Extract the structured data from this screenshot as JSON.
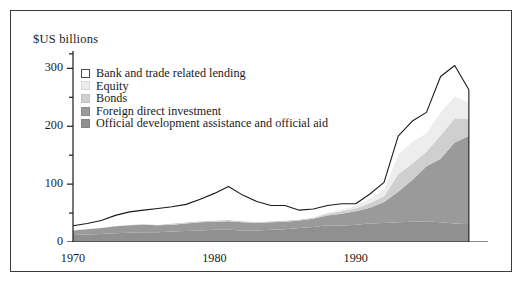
{
  "figure": {
    "axis_title": "$US billions",
    "border_color": "#3c3c3c",
    "background": "#ffffff"
  },
  "legend": {
    "items": [
      {
        "label": "Bank and trade related lending",
        "color": "#ffffff",
        "key": "bank_and_trade_related_lending"
      },
      {
        "label": "Equity",
        "color": "#ededed",
        "key": "equity"
      },
      {
        "label": "Bonds",
        "color": "#cfcfcf",
        "key": "bonds"
      },
      {
        "label": "Foreign direct investment",
        "color": "#9a9a9a",
        "key": "foreign_direct_investment"
      },
      {
        "label": "Official development assistance and official aid",
        "color": "#909090",
        "key": "official_development_assistance_and_official_aid"
      }
    ]
  },
  "chart_data": {
    "type": "area",
    "stacked": true,
    "title": "",
    "subtitle": "",
    "xlabel": "",
    "ylabel": "$US billions",
    "xlim": [
      1970,
      1999
    ],
    "ylim": [
      0,
      330
    ],
    "yticks": [
      0,
      100,
      200,
      300
    ],
    "ytick_labels": [
      "0",
      "100",
      "200",
      "300"
    ],
    "yminor_ticks": [
      50,
      150,
      250,
      325
    ],
    "xticks": [
      1970,
      1972,
      1974,
      1976,
      1978,
      1980,
      1982,
      1984,
      1986,
      1988,
      1990,
      1992,
      1994,
      1996,
      1998
    ],
    "xtick_labels_shown": [
      "1970",
      "1980",
      "1990"
    ],
    "xtick_label_years": [
      1970,
      1980,
      1990
    ],
    "grid": false,
    "legend_position": "upper-left-inside",
    "x": [
      1970,
      1971,
      1972,
      1973,
      1974,
      1975,
      1976,
      1977,
      1978,
      1979,
      1980,
      1981,
      1982,
      1983,
      1984,
      1985,
      1986,
      1987,
      1988,
      1989,
      1990,
      1991,
      1992,
      1993,
      1994,
      1995,
      1996,
      1997,
      1998
    ],
    "series": [
      {
        "name": "Official development assistance and official aid",
        "color": "#909090",
        "values": [
          12,
          13,
          14,
          15,
          16,
          17,
          17,
          18,
          19,
          20,
          21,
          21,
          20,
          20,
          21,
          22,
          24,
          26,
          29,
          28,
          30,
          32,
          33,
          34,
          35,
          36,
          34,
          32,
          33
        ]
      },
      {
        "name": "Foreign direct investment",
        "color": "#9a9a9a",
        "values": [
          8,
          9,
          10,
          12,
          13,
          13,
          12,
          12,
          13,
          14,
          14,
          15,
          14,
          13,
          13,
          13,
          13,
          14,
          17,
          21,
          23,
          27,
          36,
          53,
          72,
          95,
          110,
          140,
          150
        ]
      },
      {
        "name": "Bonds",
        "color": "#cfcfcf",
        "values": [
          1,
          1,
          1,
          1,
          1,
          1,
          1,
          2,
          2,
          2,
          2,
          2,
          2,
          2,
          2,
          2,
          2,
          2,
          3,
          4,
          5,
          8,
          10,
          30,
          28,
          25,
          40,
          42,
          30
        ]
      },
      {
        "name": "Equity",
        "color": "#ededed",
        "values": [
          0,
          0,
          0,
          0,
          0,
          0,
          0,
          0,
          0,
          0,
          0,
          0,
          0,
          0,
          0,
          0,
          0,
          1,
          2,
          3,
          4,
          8,
          12,
          34,
          38,
          32,
          40,
          38,
          28
        ]
      },
      {
        "name": "Bank and trade related lending",
        "color": "#ffffff",
        "values": [
          7,
          9,
          12,
          18,
          22,
          24,
          28,
          29,
          31,
          38,
          47,
          58,
          45,
          35,
          27,
          26,
          16,
          14,
          12,
          10,
          4,
          8,
          12,
          32,
          36,
          36,
          62,
          53,
          22
        ]
      }
    ],
    "total_line": {
      "name": "Total net resource flows",
      "color": "#1a1a1a",
      "values": [
        28,
        32,
        37,
        46,
        52,
        55,
        58,
        61,
        65,
        74,
        84,
        96,
        81,
        70,
        63,
        63,
        55,
        57,
        63,
        66,
        66,
        83,
        103,
        183,
        209,
        224,
        286,
        305,
        263
      ]
    }
  }
}
